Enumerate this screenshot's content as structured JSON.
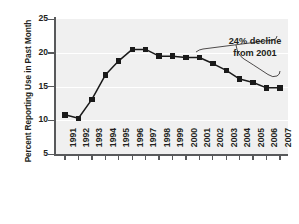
{
  "chart_data": {
    "type": "line",
    "title": "",
    "xlabel": "",
    "ylabel": "Percent Reporting Use in Past Month",
    "categories": [
      "1991",
      "1992",
      "1993",
      "1994",
      "1995",
      "1996",
      "1997",
      "1998",
      "1999",
      "2000",
      "2001",
      "2002",
      "2003",
      "2004",
      "2005",
      "2006",
      "2007"
    ],
    "values": [
      10.8,
      10.3,
      13.1,
      16.7,
      18.8,
      20.5,
      20.5,
      19.5,
      19.5,
      19.3,
      19.3,
      18.4,
      17.4,
      16.1,
      15.6,
      14.8,
      14.8
    ],
    "series": [
      {
        "name": "Percent reporting use in past month",
        "values": [
          10.8,
          10.3,
          13.1,
          16.7,
          18.8,
          20.5,
          20.5,
          19.5,
          19.5,
          19.3,
          19.3,
          18.4,
          17.4,
          16.1,
          15.6,
          14.8,
          14.8
        ]
      }
    ],
    "ylim": [
      5,
      25
    ],
    "yticks": [
      5,
      10,
      15,
      20,
      25
    ],
    "ytick_labels": [
      "5",
      "10",
      "15",
      "20",
      "25"
    ],
    "grid": true,
    "grid_axis": "y",
    "legend": false,
    "marker": "square",
    "marker_color": "#1a1a1a",
    "line_color": "#1a1a1a",
    "plot_background": "#f0f0f0",
    "gridline_color": "#ffffff",
    "axis_color": "#58595b",
    "annotations": [
      {
        "name": "decline-callout",
        "line1": "24% decline",
        "line2": "from 2001",
        "text": "24% decline from 2001",
        "points_to": "2001-2007 segment"
      }
    ]
  }
}
